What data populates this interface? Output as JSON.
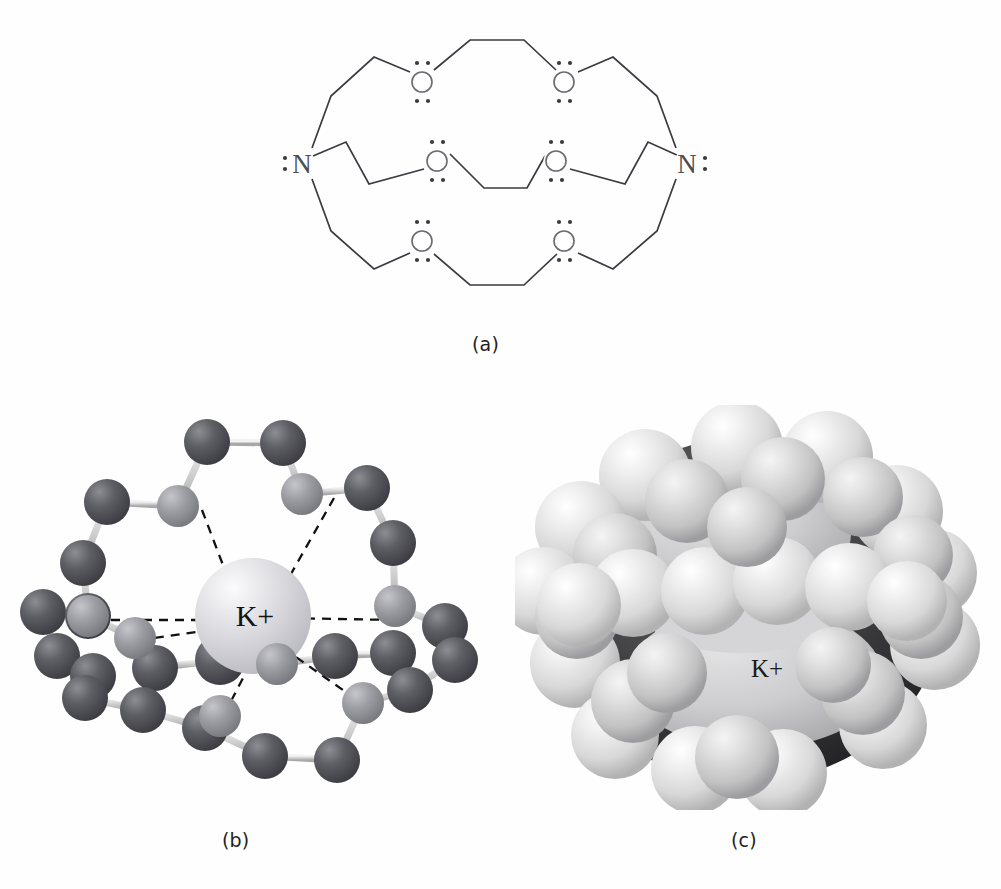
{
  "figure": {
    "background_color": "#ffffff"
  },
  "captions": {
    "a": "(a)",
    "b": "(b)",
    "c": "(c)"
  },
  "panel_a": {
    "name": "lewis-structure",
    "description": "Lewis structure of cryptand [2.2.2] with two nitrogen and six oxygen donor atoms",
    "nitrogen_label": "N",
    "oxygen_label": "O",
    "lone_pair_glyph": ":",
    "atom_color": "#4d4d52",
    "bond_color": "#3a3a40",
    "atoms": [
      {
        "id": "N-left",
        "element": "N",
        "x": 302,
        "y": 163,
        "lone_pair_side": "left"
      },
      {
        "id": "N-right",
        "element": "N",
        "x": 687,
        "y": 163,
        "lone_pair_side": "right"
      },
      {
        "id": "O-top-left",
        "element": "O",
        "x": 422,
        "y": 82
      },
      {
        "id": "O-top-right",
        "element": "O",
        "x": 564,
        "y": 82
      },
      {
        "id": "O-mid-left",
        "element": "O",
        "x": 437,
        "y": 161
      },
      {
        "id": "O-mid-right",
        "element": "O",
        "x": 556,
        "y": 161
      },
      {
        "id": "O-bottom-left",
        "element": "O",
        "x": 422,
        "y": 241
      },
      {
        "id": "O-bottom-right",
        "element": "O",
        "x": 564,
        "y": 241
      }
    ],
    "chains": [
      {
        "id": "top-strand",
        "points": "312,148 331,96 374,57 412,71 432,70 470,40 524,40 556,70 575,71 613,57 657,96 676,148"
      },
      {
        "id": "middle-strand",
        "points": "312,157 345,142 368,183 410,172 428,167 447,153 483,188 526,188 548,155 565,167 583,172 624,183 646,142 679,157"
      },
      {
        "id": "bottom-strand",
        "points": "312,179 331,231 374,269 412,253 431,254 470,285 524,285 557,254 576,253 613,269 657,231 676,179"
      }
    ]
  },
  "panel_b": {
    "name": "ball-and-stick-model",
    "description": "Ball-and-stick model of K+ encapsulated by cryptand, dashed lines are coordination bonds",
    "center_ion_label": "K+",
    "center_ion_symbol": "K",
    "center_ion_charge": "+",
    "colors": {
      "carbon": "#58585e",
      "oxygen": "#9a9aa0",
      "nitrogen": "#9a9aa0",
      "potassium": "#d8d8dc",
      "bond": "#c9c9c9",
      "dashed_bond": "#111111"
    },
    "legend": {
      "carbon": "carbon atom (dark sphere)",
      "oxygen": "oxygen atom (light sphere)",
      "potassium": "potassium ion (large pale sphere)"
    }
  },
  "panel_c": {
    "name": "space-filling-model",
    "description": "Space-filling model of the same complex; K+ visible inside the cavity",
    "center_ion_label": "K+",
    "colors": {
      "atom_sphere": "#e8e8e8",
      "highlight": "#ffffff",
      "shadow": "#2b2b2b",
      "interior_ion": "#c9c9c9"
    }
  }
}
